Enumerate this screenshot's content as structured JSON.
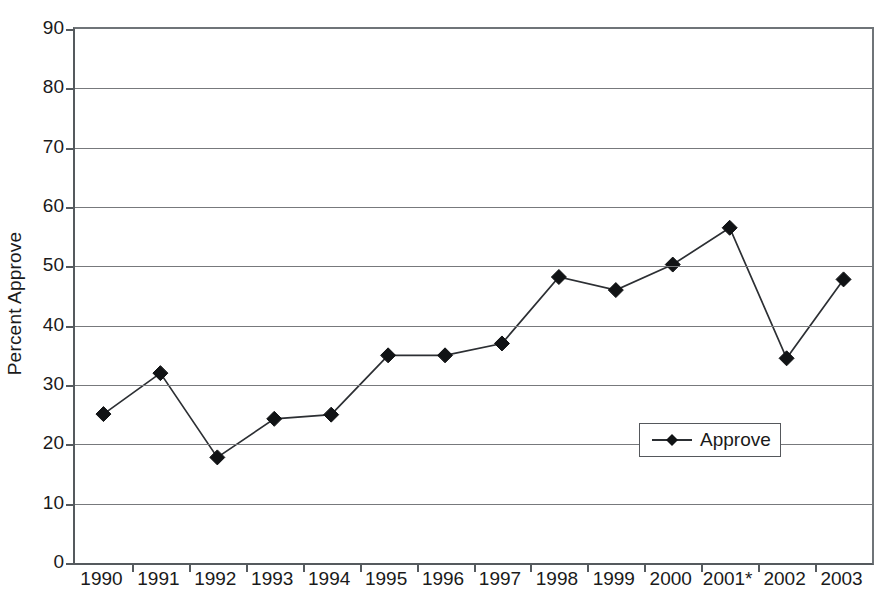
{
  "chart_data": {
    "type": "line",
    "title": "",
    "xlabel": "",
    "ylabel": "Percent Approve",
    "categories": [
      "1990",
      "1991",
      "1992",
      "1993",
      "1994",
      "1995",
      "1996",
      "1997",
      "1998",
      "1999",
      "2000",
      "2001*",
      "2002",
      "2003"
    ],
    "series": [
      {
        "name": "Approve",
        "values": [
          25.1,
          32.0,
          17.8,
          24.3,
          25.0,
          35.0,
          35.0,
          37.0,
          48.2,
          46.0,
          50.3,
          56.5,
          34.5,
          47.8
        ],
        "marker": "diamond",
        "marker_color": "#111315",
        "line_color": "#2c2f33"
      }
    ],
    "ylim": [
      0,
      90
    ],
    "y_ticks": [
      0,
      10,
      20,
      30,
      40,
      50,
      60,
      70,
      80,
      90
    ],
    "y_tick_labels": [
      "0",
      "10",
      "20",
      "30",
      "40",
      "50",
      "60",
      "70",
      "80",
      "90"
    ],
    "grid": {
      "horizontal": true,
      "vertical": false,
      "color": "#77797c"
    },
    "legend": {
      "position": "bottom-right",
      "entries": [
        "Approve"
      ],
      "border_color": "#55585c"
    },
    "axis_color": "#555a5e",
    "background": "#ffffff",
    "footnote_marker": "*"
  }
}
